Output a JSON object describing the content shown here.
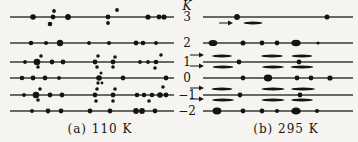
{
  "figure": {
    "k_axis_label": "K",
    "row_labels": [
      "3",
      "2",
      "1",
      "0",
      "−1",
      "−2"
    ],
    "rows_y": [
      17,
      43,
      62,
      78,
      95,
      111
    ],
    "colors": {
      "paper": "#f5f4f1",
      "line": "#3a3a3a",
      "mark": "#141414"
    },
    "panels": [
      {
        "name": "a",
        "caption": "(a) 110 K",
        "x0": 10,
        "x1": 174,
        "rows": [
          {
            "k": "3",
            "dots": [
              {
                "x": 33,
                "r": 2.8
              },
              {
                "x": 53,
                "r": 2.4
              },
              {
                "x": 68,
                "r": 2.9
              },
              {
                "x": 108,
                "r": 2.4
              },
              {
                "x": 148,
                "r": 2.6
              },
              {
                "x": 159,
                "r": 2.4
              },
              {
                "x": 164,
                "r": 2.6
              }
            ],
            "off_dots": [
              {
                "x": 54,
                "dy": -6,
                "r": 1.9
              },
              {
                "x": 117,
                "dy": -7,
                "r": 1.9
              },
              {
                "x": 50,
                "dy": 7,
                "r": 2.3
              },
              {
                "x": 108,
                "dy": 6,
                "r": 1.9
              }
            ]
          },
          {
            "k": "2",
            "dots": [
              {
                "x": 31,
                "r": 2.3
              },
              {
                "x": 46,
                "r": 2.1
              },
              {
                "x": 60,
                "r": 3.2
              },
              {
                "x": 89,
                "r": 1.9
              },
              {
                "x": 109,
                "r": 2.1
              },
              {
                "x": 136,
                "r": 2.4
              },
              {
                "x": 143,
                "r": 2.3
              },
              {
                "x": 156,
                "r": 2.0
              }
            ]
          },
          {
            "k": "1",
            "dots": [
              {
                "x": 25,
                "r": 1.9
              },
              {
                "x": 37,
                "r": 3.3
              },
              {
                "x": 52,
                "r": 2.4
              },
              {
                "x": 63,
                "r": 2.4
              },
              {
                "x": 95,
                "r": 2.4
              },
              {
                "x": 113,
                "r": 2.4
              },
              {
                "x": 140,
                "r": 1.9
              },
              {
                "x": 148,
                "r": 1.9
              },
              {
                "x": 156,
                "r": 2.3
              }
            ],
            "off_dots": [
              {
                "x": 41,
                "dy": -6,
                "r": 1.8
              },
              {
                "x": 98,
                "dy": -6,
                "r": 1.8
              },
              {
                "x": 115,
                "dy": -5,
                "r": 1.8
              },
              {
                "x": 161,
                "dy": -7,
                "r": 1.8
              },
              {
                "x": 38,
                "dy": 5,
                "r": 1.8
              },
              {
                "x": 97,
                "dy": 5,
                "r": 1.8
              },
              {
                "x": 113,
                "dy": 5,
                "r": 1.8
              },
              {
                "x": 155,
                "dy": 6,
                "r": 1.8
              }
            ]
          },
          {
            "k": "0",
            "dots": [
              {
                "x": 22,
                "r": 2.3
              },
              {
                "x": 33,
                "r": 2.4
              },
              {
                "x": 45,
                "r": 2.4
              },
              {
                "x": 59,
                "r": 1.9
              },
              {
                "x": 99,
                "r": 2.8
              },
              {
                "x": 123,
                "r": 2.4
              },
              {
                "x": 166,
                "r": 2.4
              }
            ],
            "off_dots": [
              {
                "x": 101,
                "dy": -5,
                "r": 1.5
              },
              {
                "x": 98,
                "dy": 5,
                "r": 1.7
              },
              {
                "x": 102,
                "dy": 5,
                "r": 1.4
              }
            ]
          },
          {
            "k": "-1",
            "dots": [
              {
                "x": 24,
                "r": 1.9
              },
              {
                "x": 36,
                "r": 3.3
              },
              {
                "x": 50,
                "r": 2.4
              },
              {
                "x": 62,
                "r": 2.4
              },
              {
                "x": 95,
                "r": 2.4
              },
              {
                "x": 113,
                "r": 2.4
              },
              {
                "x": 137,
                "r": 2.3
              },
              {
                "x": 144,
                "r": 2.3
              },
              {
                "x": 152,
                "r": 2.3
              },
              {
                "x": 160,
                "r": 2.8
              },
              {
                "x": 166,
                "r": 2.4
              }
            ],
            "off_dots": [
              {
                "x": 40,
                "dy": -6,
                "r": 1.8
              },
              {
                "x": 97,
                "dy": -6,
                "r": 1.8
              },
              {
                "x": 115,
                "dy": -6,
                "r": 1.8
              },
              {
                "x": 163,
                "dy": -8,
                "r": 1.8
              },
              {
                "x": 38,
                "dy": 5,
                "r": 1.8
              },
              {
                "x": 96,
                "dy": 6,
                "r": 1.8
              },
              {
                "x": 113,
                "dy": 6,
                "r": 1.8
              },
              {
                "x": 149,
                "dy": 6,
                "r": 1.8
              }
            ]
          },
          {
            "k": "-2",
            "dots": [
              {
                "x": 32,
                "r": 2.0
              },
              {
                "x": 48,
                "r": 2.4
              },
              {
                "x": 61,
                "r": 2.4
              },
              {
                "x": 90,
                "r": 2.4
              },
              {
                "x": 110,
                "r": 2.4
              },
              {
                "x": 136,
                "r": 2.9
              },
              {
                "x": 142,
                "r": 2.9
              },
              {
                "x": 155,
                "r": 2.4
              }
            ]
          }
        ]
      },
      {
        "name": "b",
        "caption": "(b) 295 K",
        "x0": 203,
        "x1": 353,
        "rows": [
          {
            "k": "3",
            "dots": [
              {
                "x": 237,
                "r": 2.9
              },
              {
                "x": 327,
                "r": 2.5
              }
            ],
            "streaks": [
              {
                "cx": 253,
                "dy": 6,
                "w": 19
              }
            ],
            "arrows": [
              {
                "x": 219,
                "dy": 6,
                "len": 14
              }
            ]
          },
          {
            "k": "2",
            "dots": [
              {
                "x": 213,
                "rx": 4.4,
                "ry": 3.1
              },
              {
                "x": 243,
                "r": 2.5
              },
              {
                "x": 262,
                "r": 2.4
              },
              {
                "x": 277,
                "r": 2.4
              },
              {
                "x": 296,
                "rx": 4.6,
                "ry": 3.3
              },
              {
                "x": 318,
                "r": 1.6
              }
            ]
          },
          {
            "k": "1",
            "dots": [
              {
                "x": 239,
                "r": 2.4
              },
              {
                "x": 299,
                "r": 2.4
              }
            ],
            "streaks": [
              {
                "cx": 222,
                "dy": -6,
                "w": 20
              },
              {
                "cx": 272,
                "dy": -6,
                "w": 22
              },
              {
                "cx": 302,
                "dy": -6,
                "w": 21
              },
              {
                "cx": 223,
                "dy": 5,
                "w": 21
              },
              {
                "cx": 273,
                "dy": 5,
                "w": 22
              },
              {
                "cx": 302,
                "dy": 5,
                "w": 23
              }
            ]
          },
          {
            "k": "0",
            "dots": [
              {
                "x": 243,
                "r": 2.4
              },
              {
                "x": 268,
                "rx": 4.2,
                "ry": 3.4
              },
              {
                "x": 297,
                "r": 2.4
              },
              {
                "x": 311,
                "r": 2.4
              },
              {
                "x": 330,
                "r": 2.6
              }
            ]
          },
          {
            "k": "-1",
            "dots": [
              {
                "x": 240,
                "r": 2.4
              },
              {
                "x": 300,
                "r": 2.4
              }
            ],
            "streaks": [
              {
                "cx": 222,
                "dy": -6,
                "w": 21
              },
              {
                "cx": 273,
                "dy": -6,
                "w": 23
              },
              {
                "cx": 303,
                "dy": -6,
                "w": 24
              },
              {
                "cx": 223,
                "dy": 5,
                "w": 22
              },
              {
                "cx": 273,
                "dy": 5,
                "w": 23
              },
              {
                "cx": 302,
                "dy": 5,
                "w": 22
              }
            ]
          },
          {
            "k": "-2",
            "dots": [
              {
                "x": 217,
                "rx": 4.4,
                "ry": 3.4
              },
              {
                "x": 243,
                "r": 2.4
              },
              {
                "x": 262,
                "r": 2.4
              },
              {
                "x": 277,
                "r": 2.1
              },
              {
                "x": 296,
                "rx": 4.8,
                "ry": 3.6
              },
              {
                "x": 317,
                "r": 2.1
              }
            ]
          }
        ]
      }
    ],
    "side_arrows": [
      {
        "x": 190,
        "y": 55,
        "len": 14
      },
      {
        "x": 190,
        "y": 66,
        "len": 14
      },
      {
        "x": 190,
        "y": 88,
        "len": 14
      },
      {
        "x": 190,
        "y": 99,
        "len": 14
      }
    ]
  }
}
